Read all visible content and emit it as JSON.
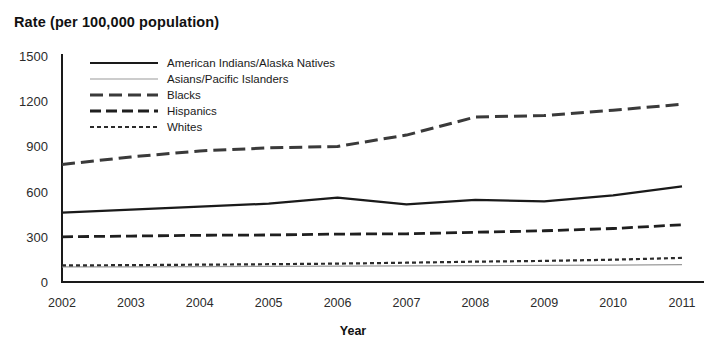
{
  "chart_data": {
    "type": "line",
    "title": "Rate (per 100,000 population)",
    "xlabel": "Year",
    "ylabel": "",
    "x": [
      2002,
      2003,
      2004,
      2005,
      2006,
      2007,
      2008,
      2009,
      2010,
      2011
    ],
    "categories": [
      "2002",
      "2003",
      "2004",
      "2005",
      "2006",
      "2007",
      "2008",
      "2009",
      "2010",
      "2011"
    ],
    "ylim": [
      0,
      1500
    ],
    "yticks": [
      0,
      300,
      600,
      900,
      1200,
      1500
    ],
    "ytick_labels": [
      "0",
      "300",
      "600",
      "900",
      "1200",
      "1500"
    ],
    "grid": false,
    "legend_position": "upper-left-inside",
    "series": [
      {
        "name": "American Indians/Alaska Natives",
        "style": "solid",
        "color": "#1a1a1a",
        "width": 2.2,
        "values": [
          460,
          480,
          500,
          520,
          560,
          515,
          545,
          535,
          575,
          635
        ]
      },
      {
        "name": "Asians/Pacific Islanders",
        "style": "solid-light",
        "color": "#9a9a9a",
        "width": 1.2,
        "values": [
          100,
          100,
          102,
          104,
          106,
          107,
          109,
          110,
          112,
          115
        ]
      },
      {
        "name": "Blacks",
        "style": "long-dash",
        "color": "#3a3a3a",
        "width": 3.0,
        "values": [
          780,
          830,
          870,
          890,
          900,
          975,
          1095,
          1105,
          1140,
          1180
        ]
      },
      {
        "name": "Hispanics",
        "style": "medium-dash",
        "color": "#1f1f1f",
        "width": 2.8,
        "values": [
          300,
          305,
          310,
          312,
          318,
          320,
          330,
          340,
          355,
          380
        ]
      },
      {
        "name": "Whites",
        "style": "fine-dot",
        "color": "#2b2b2b",
        "width": 2.2,
        "values": [
          110,
          112,
          115,
          118,
          122,
          128,
          135,
          140,
          148,
          160
        ]
      }
    ]
  },
  "legend": {
    "items": [
      {
        "label": "American Indians/Alaska Natives"
      },
      {
        "label": "Asians/Pacific Islanders"
      },
      {
        "label": "Blacks"
      },
      {
        "label": "Hispanics"
      },
      {
        "label": "Whites"
      }
    ]
  },
  "axes": {
    "axis_color": "#1a1a1a"
  }
}
